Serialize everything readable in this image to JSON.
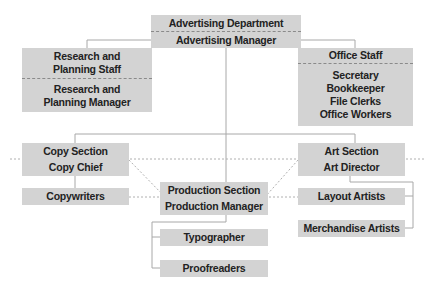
{
  "diagram": {
    "type": "org-chart",
    "colors": {
      "box_fill": "#d3d3d3",
      "line": "#a8a8a8",
      "text": "#222222"
    },
    "nodes": {
      "department": {
        "title": "Advertising Department",
        "head": "Advertising Manager"
      },
      "research": {
        "title": [
          "Research and",
          "Planning Staff"
        ],
        "head": [
          "Research and",
          "Planning Manager"
        ]
      },
      "office": {
        "title": "Office Staff",
        "members": [
          "Secretary",
          "Bookkeeper",
          "File Clerks",
          "Office Workers"
        ]
      },
      "copy": {
        "title": "Copy Section",
        "head": "Copy Chief"
      },
      "copywriters": {
        "label": "Copywriters"
      },
      "art": {
        "title": "Art Section",
        "head": "Art Director"
      },
      "production": {
        "title": "Production Section",
        "head": "Production Manager"
      },
      "layout": {
        "label": "Layout Artists"
      },
      "merchandise": {
        "label": "Merchandise Artists"
      },
      "typographer": {
        "label": "Typographer"
      },
      "proofreaders": {
        "label": "Proofreaders"
      }
    },
    "edges": [
      {
        "from": "department",
        "to": "research",
        "style": "solid"
      },
      {
        "from": "department",
        "to": "office",
        "style": "solid"
      },
      {
        "from": "department",
        "to": "production",
        "style": "solid"
      },
      {
        "from": "department",
        "to": "copy",
        "style": "solid"
      },
      {
        "from": "department",
        "to": "art",
        "style": "solid"
      },
      {
        "from": "copy",
        "to": "copywriters",
        "style": "solid"
      },
      {
        "from": "art",
        "to": "layout",
        "style": "solid"
      },
      {
        "from": "art",
        "to": "merchandise",
        "style": "solid"
      },
      {
        "from": "production",
        "to": "typographer",
        "style": "solid"
      },
      {
        "from": "production",
        "to": "proofreaders",
        "style": "solid"
      },
      {
        "from": "copy",
        "to": "art",
        "style": "dotted"
      },
      {
        "from": "copy",
        "to": "production",
        "style": "dotted"
      },
      {
        "from": "art",
        "to": "production",
        "style": "dotted"
      },
      {
        "from": "copywriters",
        "to": "layout",
        "style": "dotted"
      }
    ]
  }
}
